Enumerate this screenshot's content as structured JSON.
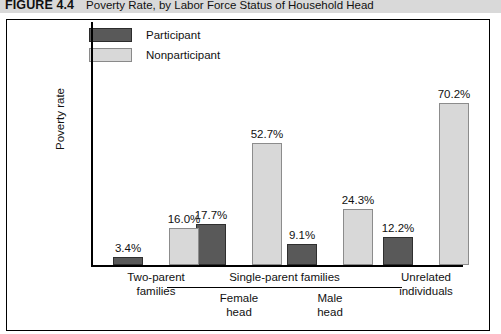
{
  "figure": {
    "number": "FIGURE 4.4",
    "title": "Poverty Rate, by Labor Force Status of Household Head"
  },
  "legend": {
    "items": [
      {
        "label": "Participant",
        "color": "#595959"
      },
      {
        "label": "Nonparticipant",
        "color": "#d8d8d8"
      }
    ]
  },
  "axes": {
    "ylabel": "Poverty rate",
    "group_label": "Single-parent families"
  },
  "chart_data": {
    "type": "bar",
    "title": "Poverty Rate, by Labor Force Status of Household Head",
    "xlabel": "",
    "ylabel": "Poverty rate",
    "ylim": [
      0,
      80
    ],
    "grid": false,
    "legend_position": "top-left",
    "categories": [
      "Two-parent families",
      "Single-parent families — Female head",
      "Single-parent families — Male head",
      "Unrelated individuals"
    ],
    "category_lines": [
      [
        "Two-parent",
        "families"
      ],
      [
        "Female",
        "head"
      ],
      [
        "Male",
        "head"
      ],
      [
        "Unrelated",
        "individuals"
      ]
    ],
    "series": [
      {
        "name": "Participant",
        "color": "#595959",
        "values": [
          3.4,
          17.7,
          9.1,
          12.2
        ],
        "labels": [
          "3.4%",
          "17.7%",
          "9.1%",
          "12.2%"
        ]
      },
      {
        "name": "Nonparticipant",
        "color": "#d8d8d8",
        "values": [
          16.0,
          52.7,
          24.3,
          70.2
        ],
        "labels": [
          "16.0%",
          "52.7%",
          "24.3%",
          "70.2%"
        ]
      }
    ]
  }
}
